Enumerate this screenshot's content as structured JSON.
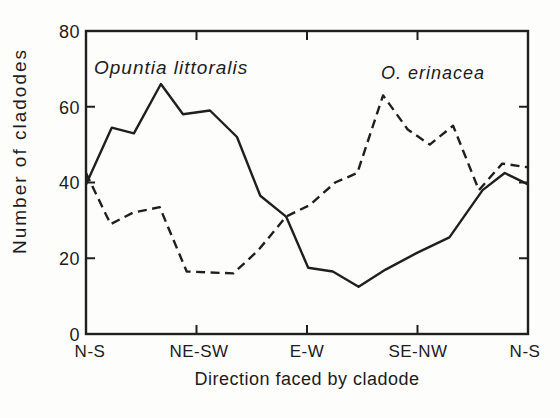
{
  "figure": {
    "background": "#fdfdfc",
    "ink_color": "#1f1f1f"
  },
  "chart_data": {
    "type": "line",
    "title": "",
    "xlabel": "Direction faced by cladode",
    "ylabel": "Number of cladodes",
    "ylim": [
      0,
      80
    ],
    "xlim_degrees": [
      0,
      180
    ],
    "grid": false,
    "legend_position": "inline-annotations",
    "y_ticks": [
      0,
      20,
      40,
      60,
      80
    ],
    "y_tick_labels": [
      "80",
      "60",
      "40",
      "20",
      "0"
    ],
    "x_tick_degrees": [
      0,
      45,
      90,
      135,
      180
    ],
    "x_tick_labels": [
      "N-S",
      "NE-SW",
      "E-W",
      "SE-NW",
      "N-S"
    ],
    "inner_ticks": {
      "y_values": [
        20,
        40,
        60
      ],
      "x_degrees": [
        45,
        90,
        135
      ],
      "length_px": 9
    },
    "series": [
      {
        "name": "Opuntia littoralis",
        "style": "solid",
        "points_deg_value": [
          [
            0,
            39.5
          ],
          [
            10.5,
            54.5
          ],
          [
            19.5,
            53
          ],
          [
            30.5,
            66
          ],
          [
            39.5,
            58
          ],
          [
            50.5,
            59
          ],
          [
            61.5,
            52
          ],
          [
            71,
            36.5
          ],
          [
            81.5,
            31
          ],
          [
            90.5,
            17.5
          ],
          [
            100.5,
            16.5
          ],
          [
            111,
            12.5
          ],
          [
            122,
            17
          ],
          [
            135,
            21.5
          ],
          [
            148,
            25.5
          ],
          [
            161.5,
            38
          ],
          [
            170.5,
            42.5
          ],
          [
            180,
            39.5
          ]
        ]
      },
      {
        "name": "O. erinacea",
        "style": "dashed",
        "points_deg_value": [
          [
            0,
            42.5
          ],
          [
            10,
            29
          ],
          [
            19,
            32
          ],
          [
            30,
            33.5
          ],
          [
            41,
            16.5
          ],
          [
            60,
            16
          ],
          [
            70,
            22
          ],
          [
            81.5,
            31
          ],
          [
            91,
            34
          ],
          [
            101.5,
            40
          ],
          [
            110.5,
            42.5
          ],
          [
            121,
            63
          ],
          [
            131,
            54
          ],
          [
            140,
            50
          ],
          [
            149.5,
            55
          ],
          [
            160,
            38
          ],
          [
            169.5,
            45
          ],
          [
            180,
            44
          ]
        ]
      }
    ]
  }
}
